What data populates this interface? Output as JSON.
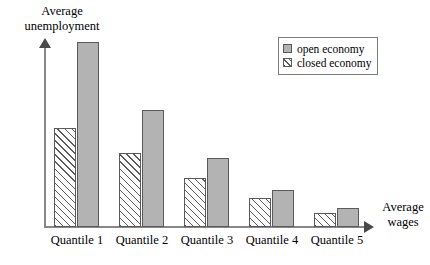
{
  "chart_data": {
    "type": "bar",
    "title": "",
    "xlabel": "Average wages",
    "ylabel": "Average unemployment",
    "categories": [
      "Quantile 1",
      "Quantile 2",
      "Quantile 3",
      "Quantile 4",
      "Quantile 5"
    ],
    "series": [
      {
        "name": "open economy",
        "values": [
          185,
          117,
          69,
          37,
          19
        ],
        "color": "#b3b3b3",
        "pattern": "solid"
      },
      {
        "name": "closed economy",
        "values": [
          99,
          74,
          49,
          29,
          14
        ],
        "color": "#fdfdfd",
        "pattern": "diagonal-hatch"
      }
    ],
    "ylim": [
      0,
      197
    ],
    "grid": false,
    "axis_ticks": false,
    "legend_position": "top-right",
    "bar_order_in_group": [
      "closed economy",
      "open economy"
    ]
  },
  "legend": {
    "entries": [
      {
        "label": "open economy",
        "swatch": "solid-gray-swatch"
      },
      {
        "label": "closed economy",
        "swatch": "hatched-swatch"
      }
    ]
  },
  "axes": {
    "y_title": "Average\nunemployment",
    "y_title_line1": "Average",
    "y_title_line2": "unemployment",
    "x_title_line1": "Average",
    "x_title_line2": "wages",
    "y_arrow": "up-arrow-icon",
    "x_arrow": "right-arrow-icon"
  },
  "colors": {
    "open_economy_fill": "#b3b3b3",
    "bar_border": "#5a5a5a",
    "axis": "#888888",
    "hatch_line": "#5a5a5a",
    "background": "#ffffff"
  }
}
